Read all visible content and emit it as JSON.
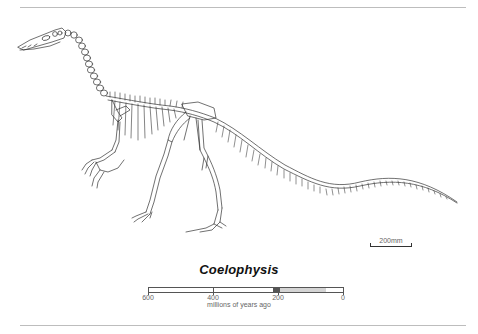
{
  "figure": {
    "title": "Coelophysis",
    "scale_bar_label": "200mm",
    "subject_icon": "dinosaur-skeleton-drawing"
  },
  "timeline": {
    "axis_label": "millions of years ago",
    "ticks": [
      {
        "value": 600,
        "label": "600"
      },
      {
        "value": 400,
        "label": "400"
      },
      {
        "value": 200,
        "label": "200"
      },
      {
        "value": 0,
        "label": "0"
      }
    ],
    "range": [
      600,
      0
    ],
    "segments": [
      {
        "name": "species-range",
        "from": 225,
        "to": 205,
        "color": "#555555"
      },
      {
        "name": "dinosaur-era",
        "from": 205,
        "to": 65,
        "color": "#d4d4d4"
      }
    ]
  },
  "colors": {
    "rule": "#bdbdbd",
    "ink": "#333333",
    "muted_text": "#666666"
  }
}
